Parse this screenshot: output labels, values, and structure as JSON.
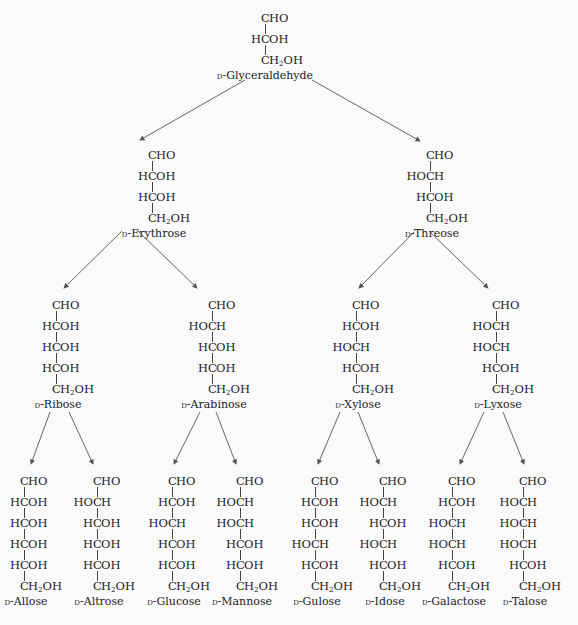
{
  "arrow_color": "#555555",
  "prefix": "D",
  "molecules": [
    {
      "id": "glyceraldehyde",
      "name": "-Glyceraldehyde",
      "x": 265,
      "y": 10,
      "rows": [
        "CHO",
        "R",
        "CH2OH"
      ]
    },
    {
      "id": "erythrose",
      "name": "-Erythrose",
      "x": 152,
      "y": 147,
      "rows": [
        "CHO",
        "R",
        "R",
        "CH2OH"
      ]
    },
    {
      "id": "threose",
      "name": "-Threose",
      "x": 430,
      "y": 147,
      "rows": [
        "CHO",
        "L",
        "R",
        "CH2OH"
      ]
    },
    {
      "id": "ribose",
      "name": "-Ribose",
      "x": 56,
      "y": 297,
      "rows": [
        "CHO",
        "R",
        "R",
        "R",
        "CH2OH"
      ]
    },
    {
      "id": "arabinose",
      "name": "-Arabinose",
      "x": 212,
      "y": 297,
      "rows": [
        "CHO",
        "L",
        "R",
        "R",
        "CH2OH"
      ]
    },
    {
      "id": "xylose",
      "name": "-Xylose",
      "x": 356,
      "y": 297,
      "rows": [
        "CHO",
        "R",
        "L",
        "R",
        "CH2OH"
      ]
    },
    {
      "id": "lyxose",
      "name": "-Lyxose",
      "x": 496,
      "y": 297,
      "rows": [
        "CHO",
        "L",
        "L",
        "R",
        "CH2OH"
      ]
    },
    {
      "id": "allose",
      "name": "-Allose",
      "x": 24,
      "y": 473,
      "rows": [
        "CHO",
        "R",
        "R",
        "R",
        "R",
        "CH2OH"
      ]
    },
    {
      "id": "altrose",
      "name": "-Altrose",
      "x": 97,
      "y": 473,
      "rows": [
        "CHO",
        "L",
        "R",
        "R",
        "R",
        "CH2OH"
      ]
    },
    {
      "id": "glucose",
      "name": "-Glucose",
      "x": 172,
      "y": 473,
      "rows": [
        "CHO",
        "R",
        "L",
        "R",
        "R",
        "CH2OH"
      ]
    },
    {
      "id": "mannose",
      "name": "-Mannose",
      "x": 240,
      "y": 473,
      "rows": [
        "CHO",
        "L",
        "L",
        "R",
        "R",
        "CH2OH"
      ]
    },
    {
      "id": "gulose",
      "name": "-Gulose",
      "x": 315,
      "y": 473,
      "rows": [
        "CHO",
        "R",
        "R",
        "L",
        "R",
        "CH2OH"
      ]
    },
    {
      "id": "idose",
      "name": "-Idose",
      "x": 383,
      "y": 473,
      "rows": [
        "CHO",
        "L",
        "R",
        "L",
        "R",
        "CH2OH"
      ]
    },
    {
      "id": "galactose",
      "name": "-Galactose",
      "x": 452,
      "y": 473,
      "rows": [
        "CHO",
        "R",
        "L",
        "L",
        "R",
        "CH2OH"
      ]
    },
    {
      "id": "talose",
      "name": "-Talose",
      "x": 523,
      "y": 473,
      "rows": [
        "CHO",
        "L",
        "L",
        "L",
        "R",
        "CH2OH"
      ]
    }
  ],
  "arrows": [
    {
      "from": "glyceraldehyde",
      "to": "erythrose",
      "x1": 245,
      "y1": 80,
      "x2": 140,
      "y2": 140
    },
    {
      "from": "glyceraldehyde",
      "to": "threose",
      "x1": 312,
      "y1": 80,
      "x2": 420,
      "y2": 141
    },
    {
      "from": "erythrose",
      "to": "ribose",
      "x1": 122,
      "y1": 231,
      "x2": 64,
      "y2": 288
    },
    {
      "from": "erythrose",
      "to": "arabinose",
      "x1": 138,
      "y1": 231,
      "x2": 197,
      "y2": 288
    },
    {
      "from": "threose",
      "to": "xylose",
      "x1": 414,
      "y1": 232,
      "x2": 359,
      "y2": 288
    },
    {
      "from": "threose",
      "to": "lyxose",
      "x1": 430,
      "y1": 232,
      "x2": 488,
      "y2": 288
    },
    {
      "from": "ribose",
      "to": "allose",
      "x1": 50,
      "y1": 412,
      "x2": 31,
      "y2": 464
    },
    {
      "from": "ribose",
      "to": "altrose",
      "x1": 69,
      "y1": 412,
      "x2": 93,
      "y2": 464
    },
    {
      "from": "arabinose",
      "to": "glucose",
      "x1": 200,
      "y1": 412,
      "x2": 174,
      "y2": 464
    },
    {
      "from": "arabinose",
      "to": "mannose",
      "x1": 216,
      "y1": 412,
      "x2": 236,
      "y2": 464
    },
    {
      "from": "xylose",
      "to": "gulose",
      "x1": 340,
      "y1": 412,
      "x2": 318,
      "y2": 464
    },
    {
      "from": "xylose",
      "to": "idose",
      "x1": 358,
      "y1": 412,
      "x2": 379,
      "y2": 464
    },
    {
      "from": "lyxose",
      "to": "galactose",
      "x1": 484,
      "y1": 412,
      "x2": 460,
      "y2": 464
    },
    {
      "from": "lyxose",
      "to": "talose",
      "x1": 503,
      "y1": 412,
      "x2": 524,
      "y2": 464
    }
  ],
  "groups": {
    "CHO": {
      "l": "",
      "c": "C",
      "r": "HO"
    },
    "R": {
      "l": "H",
      "c": "C",
      "r": "OH"
    },
    "L": {
      "l": "HO",
      "c": "C",
      "r": "H"
    },
    "CH2OH": {
      "l": "",
      "c": "C",
      "r": "H2OH"
    }
  }
}
